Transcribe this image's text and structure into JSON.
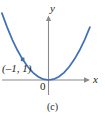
{
  "figure": {
    "caption": "(c)",
    "axes": {
      "x_label": "x",
      "y_label": "y",
      "origin_label": "0",
      "axis_color": "#8a8a8a",
      "x_axis_y_px": 80,
      "y_axis_x_px": 48.5,
      "x_axis_start_px": 2,
      "x_axis_end_px": 90,
      "y_axis_top_px": 18,
      "y_axis_bottom_px": 95
    },
    "annotations": [
      {
        "name": "point-label",
        "text": "(–1, 1)",
        "marker_color": "#3f6fb5",
        "marker_x_px": 31,
        "marker_y_px": 51
      }
    ]
  },
  "chart_data": {
    "type": "line",
    "title": "",
    "subtitle": "",
    "xlabel": "x",
    "ylabel": "y",
    "caption": "(c)",
    "function": "y = x^2",
    "curve_color": "#3f6fb5",
    "grid": false,
    "legend": null,
    "xlim": [
      -1.8,
      1.6
    ],
    "ylim": [
      -0.4,
      3.2
    ],
    "x": [
      -1.8,
      -1.6,
      -1.4,
      -1.2,
      -1.0,
      -0.8,
      -0.6,
      -0.4,
      -0.2,
      0.0,
      0.2,
      0.4,
      0.6,
      0.8,
      1.0,
      1.2,
      1.4,
      1.6
    ],
    "y": [
      3.24,
      2.56,
      1.96,
      1.44,
      1.0,
      0.64,
      0.36,
      0.16,
      0.04,
      0.0,
      0.04,
      0.16,
      0.36,
      0.64,
      1.0,
      1.44,
      1.96,
      2.56
    ],
    "points": [
      {
        "x": -1,
        "y": 1,
        "label": "(–1, 1)",
        "marker": "square",
        "color": "#3f6fb5"
      }
    ],
    "vertex": {
      "x": 0,
      "y": 0
    },
    "xticks": [],
    "yticks": []
  }
}
